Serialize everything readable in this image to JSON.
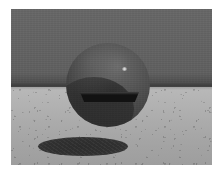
{
  "scene": {
    "title": "Ray-traced sphere over textured ground plane",
    "kind": "rendered-3d-scene",
    "canvas": {
      "width_px": 220,
      "height_px": 171,
      "page_background": "#ffffff",
      "render_left_px": 11,
      "render_top_px": 9,
      "render_width_px": 201,
      "render_height_px": 156
    },
    "sky": {
      "name": "backdrop-wall",
      "top_color": "#676767",
      "bottom_color": "#474747",
      "height_px": 78
    },
    "horizon": {
      "name": "horizon-line",
      "y_px": 74,
      "thickness_px": 5,
      "color": "#3d3d3d"
    },
    "ground": {
      "name": "ground-plane",
      "near_color": "#9e9e9e",
      "far_color": "#b9b9b9",
      "texture": "speckled-noise",
      "height_px": 78
    },
    "sphere": {
      "name": "floating-sphere",
      "center_x_px": 97,
      "center_y_px": 76,
      "radius_px": 42,
      "base_color": "#4a4a4a",
      "light_color": "#6a6a6a",
      "dark_color": "#2c2c2c",
      "specular": {
        "name": "specular-highlight",
        "x_pct": 67,
        "y_pct": 29,
        "color": "#e8e8e8",
        "size_px": 5
      },
      "slot": {
        "name": "dark-equatorial-slot",
        "left_px": 14,
        "top_px": 49,
        "width_px": 59,
        "height_px": 10,
        "color": "#121212"
      }
    },
    "shadow": {
      "name": "cast-shadow-ellipse",
      "left_px": 27,
      "top_px": 128,
      "width_px": 90,
      "height_px": 19,
      "core_color": "#2e2e2e",
      "edge_color": "#4c4c4c"
    }
  }
}
